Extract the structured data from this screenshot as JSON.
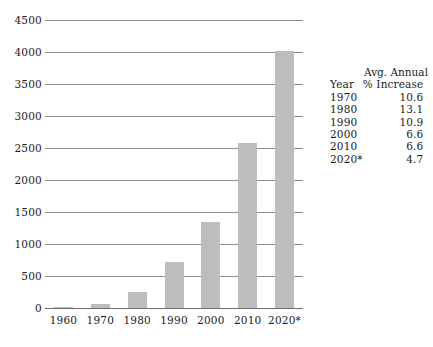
{
  "chart_data": {
    "type": "bar",
    "title": "",
    "subtitle": "",
    "xlabel": "",
    "ylabel": "",
    "categories": [
      "1960",
      "1970",
      "1980",
      "1990",
      "2000",
      "2010",
      "2020*"
    ],
    "values": [
      20,
      70,
      250,
      720,
      1350,
      2580,
      4010
    ],
    "ylim": [
      0,
      4500
    ],
    "yticks": [
      4500,
      4000,
      3500,
      3000,
      2500,
      2000,
      1500,
      1000,
      500,
      0
    ],
    "ytick_labels": [
      "4500",
      "4000",
      "3500",
      "3000",
      "2500",
      "2000",
      "1500",
      "1000",
      "500",
      "0"
    ],
    "grid": true,
    "legend": "none",
    "bar_color": "#bdbdbd",
    "gridline_color": "#8d8d8d",
    "series": [
      {
        "name": "value",
        "values": [
          20,
          70,
          250,
          720,
          1350,
          2580,
          4010
        ]
      }
    ]
  },
  "side_table": {
    "header_line1": "Avg. Annual",
    "header_year": "Year",
    "header_pct": "% Increase",
    "rows": [
      {
        "year": "1970",
        "pct": "10.6"
      },
      {
        "year": "1980",
        "pct": "13.1"
      },
      {
        "year": "1990",
        "pct": "10.9"
      },
      {
        "year": "2000",
        "pct": "6.6"
      },
      {
        "year": "2010",
        "pct": "6.6"
      },
      {
        "year": "2020*",
        "pct": "4.7"
      }
    ]
  }
}
